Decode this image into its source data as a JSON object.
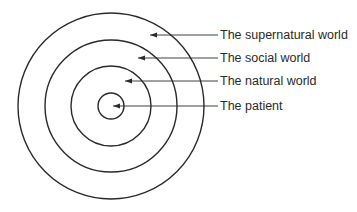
{
  "diagram": {
    "type": "concentric-circles",
    "center": {
      "x": 111,
      "y": 106
    },
    "stroke_color": "#2a2a2a",
    "rings": [
      {
        "name": "supernatural",
        "radius": 93
      },
      {
        "name": "social",
        "radius": 66
      },
      {
        "name": "natural",
        "radius": 40
      },
      {
        "name": "patient",
        "radius": 13
      }
    ],
    "labels": [
      {
        "text": "The supernatural world",
        "y": 35,
        "arrow_tip_x": 150
      },
      {
        "text": "The social world",
        "y": 58,
        "arrow_tip_x": 138
      },
      {
        "text": "The natural world",
        "y": 81,
        "arrow_tip_x": 125
      },
      {
        "text": "The patient",
        "y": 106,
        "arrow_tip_x": 113
      }
    ]
  }
}
